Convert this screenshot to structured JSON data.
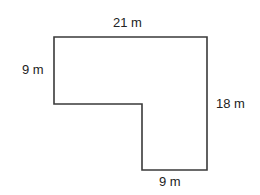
{
  "diagram": {
    "type": "L-shaped floor plan",
    "stroke_color": "#3a3a3a",
    "labels": {
      "top": "21 m",
      "left": "9 m",
      "right": "18 m",
      "bottom": "9 m"
    },
    "vertices": [
      [
        54,
        37
      ],
      [
        207,
        37
      ],
      [
        207,
        170
      ],
      [
        142,
        170
      ],
      [
        142,
        104
      ],
      [
        54,
        104
      ]
    ]
  }
}
